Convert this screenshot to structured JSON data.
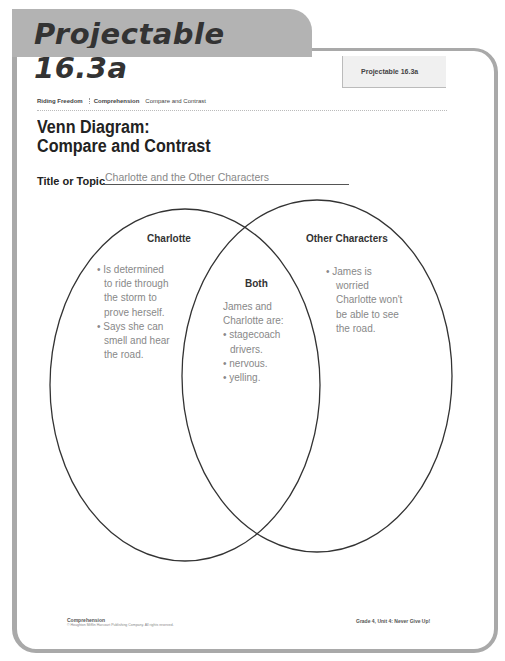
{
  "header": {
    "tab_title": "Projectable 16.3a",
    "badge_label": "Projectable 16.3a"
  },
  "breadcrumb": {
    "story": "Riding Freedom",
    "skill": "Comprehension",
    "topic": "Compare and Contrast"
  },
  "page_title": {
    "line1": "Venn Diagram:",
    "line2": "Compare and Contrast"
  },
  "topic_field": {
    "label": "Title or Topic",
    "value": "Charlotte and the Other Characters"
  },
  "venn": {
    "left": {
      "heading": "Charlotte",
      "lines": [
        "• Is determined",
        "to ride through",
        "the storm to",
        "prove herself.",
        "• Says she can",
        "smell and hear",
        "the road."
      ]
    },
    "center": {
      "heading": "Both",
      "lines": [
        "James and",
        "Charlotte are:",
        "• stagecoach",
        "drivers.",
        "• nervous.",
        "• yelling."
      ]
    },
    "right": {
      "heading": "Other Characters",
      "lines": [
        "•  James is",
        "worried",
        "Charlotte won't",
        "be able to see",
        "the road."
      ]
    }
  },
  "footer": {
    "left_title": "Comprehension",
    "copyright": "© Houghton Mifflin Harcourt Publishing Company. All rights reserved.",
    "right": "Grade 4, Unit 4: Never Give Up!"
  }
}
